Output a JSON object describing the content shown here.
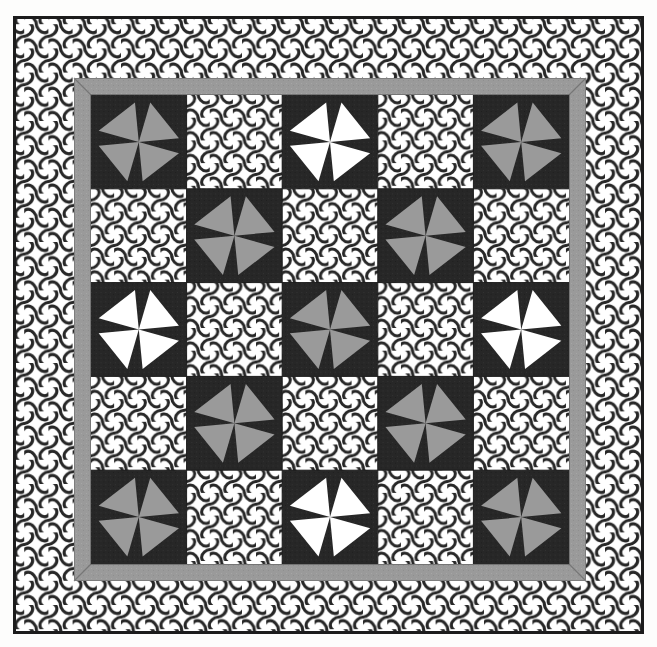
{
  "artwork": {
    "title": "Pinwheel Patchwork Quilt",
    "type": "quilt-pattern-illustration",
    "medium": "black-and-white line illustration",
    "canvas": {
      "width": 657,
      "height": 647
    },
    "background_color": "#fdfdfc"
  },
  "palette": {
    "dark": "#272727",
    "gray": "#9a9a9a",
    "white": "#ffffff",
    "outline": "#1c1c1c",
    "paper": "#fdfdfc"
  },
  "outer_border": {
    "name": "lattice-border",
    "fill_pattern": "quatrefoil-lattice",
    "outline_color": "#1c1c1c",
    "outline_width": 3,
    "rect": {
      "x": 13,
      "y": 16,
      "width": 631,
      "height": 618
    }
  },
  "inner_sashing": {
    "name": "gray-frame",
    "color": "#9a9a9a",
    "thickness": 17,
    "mitered_corners": true,
    "rect": {
      "x": 74,
      "y": 78,
      "width": 512,
      "height": 503
    }
  },
  "quilt_field": {
    "name": "block-grid",
    "rect": {
      "x": 91,
      "y": 95,
      "width": 478,
      "height": 469
    },
    "rows": 5,
    "cols": 5,
    "cell_width": 95.6,
    "cell_height": 93.8
  },
  "legend": {
    "pinwheel_gray_label": "Gray pinwheel block",
    "pinwheel_white_label": "White pinwheel block",
    "lattice_label": "Lattice print block"
  },
  "chart_data": {
    "type": "heatmap",
    "xlabel": "",
    "ylabel": "",
    "categories": [
      "C1",
      "C2",
      "C3",
      "C4",
      "C5"
    ],
    "row_labels": [
      "R1",
      "R2",
      "R3",
      "R4",
      "R5"
    ],
    "legend": [
      "pinwheel-gray",
      "pinwheel-white",
      "lattice"
    ],
    "grid": [
      [
        "pinwheel-gray",
        "lattice",
        "pinwheel-white",
        "lattice",
        "pinwheel-gray"
      ],
      [
        "lattice",
        "pinwheel-gray",
        "lattice",
        "pinwheel-gray",
        "lattice"
      ],
      [
        "pinwheel-white",
        "lattice",
        "pinwheel-gray",
        "lattice",
        "pinwheel-white"
      ],
      [
        "lattice",
        "pinwheel-gray",
        "lattice",
        "pinwheel-gray",
        "lattice"
      ],
      [
        "pinwheel-gray",
        "lattice",
        "pinwheel-white",
        "lattice",
        "pinwheel-gray"
      ]
    ],
    "values": [
      [
        1,
        0,
        2,
        0,
        1
      ],
      [
        0,
        1,
        0,
        1,
        0
      ],
      [
        2,
        0,
        1,
        0,
        2
      ],
      [
        0,
        1,
        0,
        1,
        0
      ],
      [
        1,
        0,
        2,
        0,
        1
      ]
    ],
    "value_key": {
      "0": "lattice",
      "1": "pinwheel-gray",
      "2": "pinwheel-white"
    },
    "counts": {
      "pinwheel-gray": 9,
      "pinwheel-white": 4,
      "lattice": 12,
      "total_blocks": 25
    },
    "grid_on": true,
    "legend_position": "none"
  }
}
